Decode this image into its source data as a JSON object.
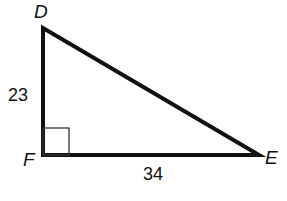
{
  "diagram": {
    "type": "right-triangle",
    "vertices": {
      "D": {
        "label": "D"
      },
      "F": {
        "label": "F"
      },
      "E": {
        "label": "E"
      }
    },
    "sides": {
      "DF": {
        "label": "23"
      },
      "FE": {
        "label": "34"
      }
    },
    "right_angle_at": "F",
    "colors": {
      "stroke": "#111111",
      "background": "#ffffff"
    }
  }
}
